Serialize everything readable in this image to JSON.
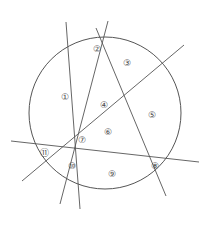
{
  "figure": {
    "background_color": "#ffffff",
    "stroke_color": "#555555",
    "label_color": "#4a4a4a",
    "circle": {
      "name": "main-circle",
      "cx": 105,
      "cy": 113,
      "r": 76
    },
    "lines": [
      {
        "name": "line-a",
        "description": "steep line from upper-left through centre down to bottom",
        "x1": 66,
        "y1": 22,
        "x2": 80,
        "y2": 209
      },
      {
        "name": "line-b",
        "description": "near-vertical line from top through the middle to lower area",
        "x1": 108,
        "y1": 21,
        "x2": 60,
        "y2": 204
      },
      {
        "name": "line-c",
        "description": "diagonal line from upper-right down to lower-left",
        "x1": 184,
        "y1": 45,
        "x2": 22,
        "y2": 181
      },
      {
        "name": "line-d",
        "description": "diagonal line from the middle-top down to the lower-right",
        "x1": 96,
        "y1": 28,
        "x2": 166,
        "y2": 196
      },
      {
        "name": "line-e",
        "description": "near-horizontal line crossing from left edge to right edge",
        "x1": 11,
        "y1": 141,
        "x2": 199,
        "y2": 162
      }
    ],
    "regions": [
      {
        "name": "region-1",
        "label": "①",
        "x": 65,
        "y": 97
      },
      {
        "name": "region-2",
        "label": "②",
        "x": 97,
        "y": 49
      },
      {
        "name": "region-3",
        "label": "③",
        "x": 127,
        "y": 63
      },
      {
        "name": "region-4",
        "label": "④",
        "x": 104,
        "y": 105
      },
      {
        "name": "region-5",
        "label": "⑤",
        "x": 152,
        "y": 115
      },
      {
        "name": "region-6",
        "label": "⑥",
        "x": 108,
        "y": 132
      },
      {
        "name": "region-7",
        "label": "⑦",
        "x": 82,
        "y": 140
      },
      {
        "name": "region-8",
        "label": "⑧",
        "x": 155,
        "y": 166
      },
      {
        "name": "region-9",
        "label": "⑨",
        "x": 112,
        "y": 174
      },
      {
        "name": "region-10",
        "label": "⑩",
        "x": 72,
        "y": 166
      },
      {
        "name": "region-11",
        "label": "⑪",
        "x": 44,
        "y": 153
      }
    ]
  }
}
